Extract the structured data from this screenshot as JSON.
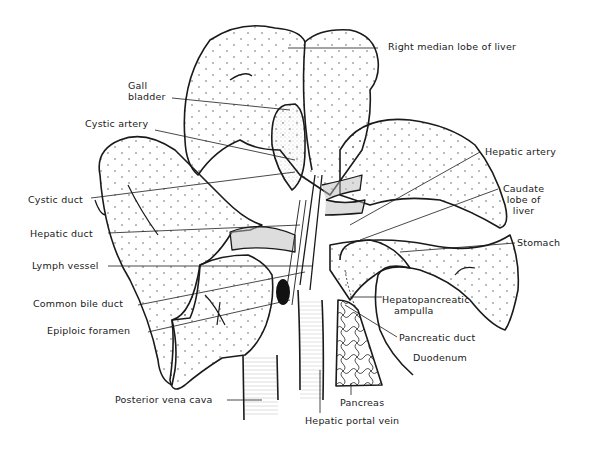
{
  "figure": {
    "type": "anatomical line drawing"
  },
  "labels": {
    "right_median_lobe": "Right median lobe of liver",
    "gall_bladder_1": "Gall",
    "gall_bladder_2": "bladder",
    "cystic_artery": "Cystic artery",
    "hepatic_artery": "Hepatic artery",
    "caudate_1": "Caudate",
    "caudate_2": "lobe of",
    "caudate_3": "liver",
    "cystic_duct": "Cystic duct",
    "hepatic_duct": "Hepatic duct",
    "stomach": "Stomach",
    "lymph_vessel": "Lymph vessel",
    "common_bile_duct": "Common bile duct",
    "hepatopancreatic_1": "Hepatopancreatic",
    "hepatopancreatic_2": "ampulla",
    "epiploic_foramen": "Epiploic foramen",
    "pancreatic_duct": "Pancreatic duct",
    "duodenum": "Duodenum",
    "posterior_vena_cava": "Posterior vena cava",
    "pancreas": "Pancreas",
    "hepatic_portal_vein": "Hepatic portal vein"
  },
  "colors": {
    "ink": "#1a1a1a",
    "background": "#ffffff"
  }
}
